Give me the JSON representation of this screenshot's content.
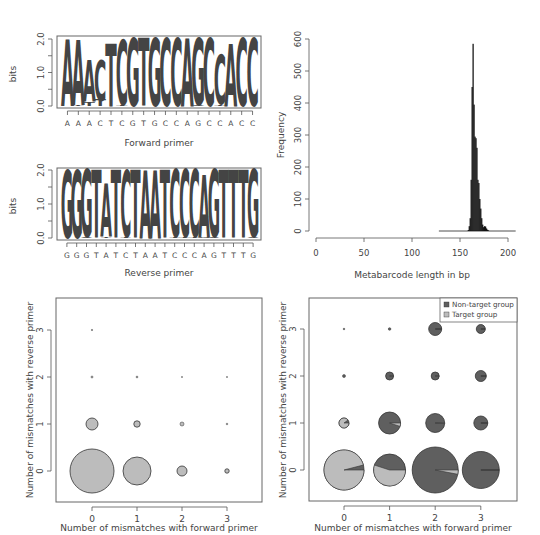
{
  "colors": {
    "dark": "#5f5f5f",
    "mid": "#6e6e6e",
    "light": "#bcbcbc",
    "black": "#111111",
    "axis": "#555555"
  },
  "chart_data": [
    {
      "id": "forward-logo",
      "type": "sequence-logo",
      "title": "",
      "xlabel": "Forward primer",
      "ylabel": "bits",
      "ylim": [
        0,
        2
      ],
      "yticks": [
        "0.0",
        "1.0",
        "2.0"
      ],
      "categories": [
        "A",
        "A",
        "A",
        "C",
        "T",
        "C",
        "G",
        "T",
        "G",
        "C",
        "C",
        "A",
        "G",
        "C",
        "C",
        "A",
        "C",
        "C"
      ],
      "columns": [
        {
          "consensus": "A",
          "height": 2.0,
          "stack": [
            {
              "l": "A",
              "h": 1.98
            }
          ]
        },
        {
          "consensus": "A",
          "height": 2.0,
          "stack": [
            {
              "l": "A",
              "h": 1.96
            },
            {
              "l": "T",
              "h": 0.02
            }
          ]
        },
        {
          "consensus": "A",
          "height": 1.4,
          "stack": [
            {
              "l": "A",
              "h": 1.25
            },
            {
              "l": "T",
              "h": 0.12
            }
          ]
        },
        {
          "consensus": "C",
          "height": 1.4,
          "stack": [
            {
              "l": "C",
              "h": 1.2
            },
            {
              "l": "T",
              "h": 0.18
            }
          ]
        },
        {
          "consensus": "T",
          "height": 1.9,
          "stack": [
            {
              "l": "T",
              "h": 1.88
            }
          ]
        },
        {
          "consensus": "C",
          "height": 2.0,
          "stack": [
            {
              "l": "C",
              "h": 1.96
            },
            {
              "l": "T",
              "h": 0.02
            }
          ]
        },
        {
          "consensus": "G",
          "height": 2.0,
          "stack": [
            {
              "l": "G",
              "h": 2.0
            }
          ]
        },
        {
          "consensus": "T",
          "height": 2.0,
          "stack": [
            {
              "l": "T",
              "h": 2.0
            }
          ]
        },
        {
          "consensus": "G",
          "height": 2.0,
          "stack": [
            {
              "l": "G",
              "h": 2.0
            }
          ]
        },
        {
          "consensus": "C",
          "height": 2.0,
          "stack": [
            {
              "l": "C",
              "h": 2.0
            }
          ]
        },
        {
          "consensus": "C",
          "height": 2.0,
          "stack": [
            {
              "l": "C",
              "h": 2.0
            }
          ]
        },
        {
          "consensus": "A",
          "height": 2.0,
          "stack": [
            {
              "l": "A",
              "h": 2.0
            }
          ]
        },
        {
          "consensus": "G",
          "height": 2.0,
          "stack": [
            {
              "l": "G",
              "h": 1.98
            },
            {
              "l": "A",
              "h": 0.02
            }
          ]
        },
        {
          "consensus": "C",
          "height": 2.0,
          "stack": [
            {
              "l": "C",
              "h": 2.0
            }
          ]
        },
        {
          "consensus": "C",
          "height": 1.55,
          "stack": [
            {
              "l": "C",
              "h": 1.48
            },
            {
              "l": "T",
              "h": 0.05
            }
          ]
        },
        {
          "consensus": "A",
          "height": 1.85,
          "stack": [
            {
              "l": "A",
              "h": 1.85
            }
          ]
        },
        {
          "consensus": "C",
          "height": 2.0,
          "stack": [
            {
              "l": "C",
              "h": 2.0
            }
          ]
        },
        {
          "consensus": "C",
          "height": 2.0,
          "stack": [
            {
              "l": "C",
              "h": 2.0
            }
          ]
        }
      ]
    },
    {
      "id": "reverse-logo",
      "type": "sequence-logo",
      "title": "",
      "xlabel": "Reverse primer",
      "ylabel": "bits",
      "ylim": [
        0,
        2
      ],
      "yticks": [
        "0.0",
        "1.0",
        "2.0"
      ],
      "categories": [
        "G",
        "G",
        "G",
        "T",
        "A",
        "T",
        "C",
        "T",
        "A",
        "A",
        "T",
        "C",
        "C",
        "C",
        "A",
        "G",
        "T",
        "T",
        "T",
        "G"
      ],
      "columns": [
        {
          "consensus": "G",
          "height": 2.0,
          "stack": [
            {
              "l": "G",
              "h": 2.0
            }
          ]
        },
        {
          "consensus": "G",
          "height": 2.0,
          "stack": [
            {
              "l": "G",
              "h": 2.0
            }
          ]
        },
        {
          "consensus": "G",
          "height": 2.0,
          "stack": [
            {
              "l": "G",
              "h": 1.97
            },
            {
              "l": "A",
              "h": 0.03
            }
          ]
        },
        {
          "consensus": "T",
          "height": 2.0,
          "stack": [
            {
              "l": "T",
              "h": 2.0
            }
          ]
        },
        {
          "consensus": "A",
          "height": 1.6,
          "stack": [
            {
              "l": "A",
              "h": 1.55
            },
            {
              "l": "T",
              "h": 0.04
            }
          ]
        },
        {
          "consensus": "T",
          "height": 2.0,
          "stack": [
            {
              "l": "T",
              "h": 2.0
            }
          ]
        },
        {
          "consensus": "C",
          "height": 2.0,
          "stack": [
            {
              "l": "C",
              "h": 1.96
            },
            {
              "l": "T",
              "h": 0.03
            }
          ]
        },
        {
          "consensus": "T",
          "height": 2.0,
          "stack": [
            {
              "l": "T",
              "h": 2.0
            }
          ]
        },
        {
          "consensus": "A",
          "height": 2.0,
          "stack": [
            {
              "l": "A",
              "h": 2.0
            }
          ]
        },
        {
          "consensus": "A",
          "height": 2.0,
          "stack": [
            {
              "l": "A",
              "h": 2.0
            }
          ]
        },
        {
          "consensus": "T",
          "height": 2.0,
          "stack": [
            {
              "l": "T",
              "h": 2.0
            }
          ]
        },
        {
          "consensus": "C",
          "height": 2.0,
          "stack": [
            {
              "l": "C",
              "h": 1.98
            },
            {
              "l": "T",
              "h": 0.02
            }
          ]
        },
        {
          "consensus": "C",
          "height": 2.0,
          "stack": [
            {
              "l": "C",
              "h": 1.98
            },
            {
              "l": "T",
              "h": 0.02
            }
          ]
        },
        {
          "consensus": "C",
          "height": 2.0,
          "stack": [
            {
              "l": "C",
              "h": 1.98
            },
            {
              "l": "T",
              "h": 0.02
            }
          ]
        },
        {
          "consensus": "A",
          "height": 1.85,
          "stack": [
            {
              "l": "A",
              "h": 1.82
            },
            {
              "l": "G",
              "h": 0.03
            }
          ]
        },
        {
          "consensus": "G",
          "height": 2.0,
          "stack": [
            {
              "l": "G",
              "h": 1.98
            },
            {
              "l": "A",
              "h": 0.02
            }
          ]
        },
        {
          "consensus": "T",
          "height": 2.0,
          "stack": [
            {
              "l": "T",
              "h": 2.0
            }
          ]
        },
        {
          "consensus": "T",
          "height": 2.0,
          "stack": [
            {
              "l": "T",
              "h": 2.0
            }
          ]
        },
        {
          "consensus": "T",
          "height": 2.0,
          "stack": [
            {
              "l": "T",
              "h": 2.0
            }
          ]
        },
        {
          "consensus": "G",
          "height": 2.0,
          "stack": [
            {
              "l": "G",
              "h": 1.98
            },
            {
              "l": "A",
              "h": 0.02
            }
          ]
        }
      ]
    },
    {
      "id": "length-histogram",
      "type": "bar",
      "title": "",
      "xlabel": "Metabarcode length in bp",
      "ylabel": "Frequency",
      "xlim": [
        0,
        200
      ],
      "ylim": [
        0,
        600
      ],
      "xticks": [
        0,
        50,
        100,
        150,
        200
      ],
      "yticks": [
        0,
        100,
        200,
        300,
        400,
        500,
        600
      ],
      "baseline_range": [
        128,
        208
      ],
      "bins_start": 158,
      "bin_width": 1,
      "values": [
        3,
        15,
        40,
        160,
        450,
        585,
        395,
        295,
        290,
        260,
        160,
        150,
        100,
        70,
        40,
        20,
        12,
        15,
        14,
        8,
        4,
        2
      ]
    },
    {
      "id": "mismatch-bubble-target",
      "type": "scatter",
      "title": "",
      "xlabel": "Number of mismatches with forward primer",
      "ylabel": "Number of mismatches with reverse primer",
      "xlim": [
        -0.75,
        3.75
      ],
      "ylim": [
        -0.65,
        3.65
      ],
      "xticks": [
        0,
        1,
        2,
        3
      ],
      "yticks": [
        0,
        1,
        2,
        3
      ],
      "points": [
        {
          "x": 0,
          "y": 0,
          "r": 22
        },
        {
          "x": 1,
          "y": 0,
          "r": 14
        },
        {
          "x": 2,
          "y": 0,
          "r": 5
        },
        {
          "x": 3,
          "y": 0,
          "r": 2.2
        },
        {
          "x": 0,
          "y": 1,
          "r": 6
        },
        {
          "x": 1,
          "y": 1,
          "r": 3.2
        },
        {
          "x": 2,
          "y": 1,
          "r": 2
        },
        {
          "x": 3,
          "y": 1,
          "r": 0.8
        },
        {
          "x": 0,
          "y": 2,
          "r": 1
        },
        {
          "x": 1,
          "y": 2,
          "r": 0.9
        },
        {
          "x": 2,
          "y": 2,
          "r": 0.6
        },
        {
          "x": 3,
          "y": 2,
          "r": 0.6
        },
        {
          "x": 0,
          "y": 3,
          "r": 0.7
        }
      ]
    },
    {
      "id": "mismatch-pie-bubble",
      "type": "scatter",
      "title": "",
      "xlabel": "Number of mismatches with forward primer",
      "ylabel": "Number of mismatches with reverse primer",
      "xlim": [
        -0.75,
        3.75
      ],
      "ylim": [
        -0.65,
        3.65
      ],
      "xticks": [
        0,
        1,
        2,
        3
      ],
      "yticks": [
        0,
        1,
        2,
        3
      ],
      "legend": [
        {
          "label": "Non-target group",
          "color": "dark"
        },
        {
          "label": "Target group",
          "color": "light"
        }
      ],
      "points": [
        {
          "x": 0,
          "y": 0,
          "r": 20,
          "target_fraction": 0.96
        },
        {
          "x": 1,
          "y": 0,
          "r": 16,
          "target_fraction": 0.55
        },
        {
          "x": 2,
          "y": 0,
          "r": 23,
          "target_fraction": 0.03
        },
        {
          "x": 3,
          "y": 0,
          "r": 18.5,
          "target_fraction": 0.0
        },
        {
          "x": 0,
          "y": 1,
          "r": 5,
          "target_fraction": 0.9
        },
        {
          "x": 1,
          "y": 1,
          "r": 11,
          "target_fraction": 0.05
        },
        {
          "x": 2,
          "y": 1,
          "r": 9.5,
          "target_fraction": 0.01
        },
        {
          "x": 3,
          "y": 1,
          "r": 7,
          "target_fraction": 0.0
        },
        {
          "x": 0,
          "y": 2,
          "r": 1.5,
          "target_fraction": 0.0
        },
        {
          "x": 1,
          "y": 2,
          "r": 4,
          "target_fraction": 0.02
        },
        {
          "x": 2,
          "y": 2,
          "r": 4,
          "target_fraction": 0.01
        },
        {
          "x": 3,
          "y": 2,
          "r": 5.5,
          "target_fraction": 0.0
        },
        {
          "x": 0,
          "y": 3,
          "r": 0.8,
          "target_fraction": 0.0
        },
        {
          "x": 1,
          "y": 3,
          "r": 1.3,
          "target_fraction": 0.0
        },
        {
          "x": 2,
          "y": 3,
          "r": 6.5,
          "target_fraction": 0.0
        },
        {
          "x": 3,
          "y": 3,
          "r": 4.5,
          "target_fraction": 0.0
        }
      ]
    }
  ]
}
